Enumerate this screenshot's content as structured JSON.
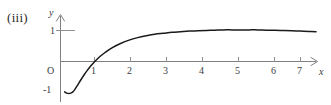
{
  "figure": {
    "label": "(iii)",
    "background_color": "#ffffff",
    "curve_color": "#1a1a1a",
    "axis_color": "#808080"
  },
  "chart_data": {
    "type": "line",
    "title": "",
    "subtitle": "",
    "xlabel": "x",
    "ylabel": "y",
    "figure_label": "(iii)",
    "origin_label": "O",
    "grid": false,
    "legend": null,
    "xlim": [
      -0.3,
      7.6
    ],
    "ylim": [
      -1.25,
      1.45
    ],
    "xticks": [
      1,
      2,
      3,
      4,
      5,
      6,
      7
    ],
    "xtick_labels": [
      "1",
      "2",
      "3",
      "4",
      "5",
      "6",
      "7"
    ],
    "yticks": [
      1
    ],
    "ytick_labels": [
      "1"
    ],
    "y_negative_ticks": [
      -1
    ],
    "y_negative_tick_labels": [
      "-1"
    ],
    "annotations": [],
    "series": [
      {
        "name": "curve",
        "x": [
          0.12,
          0.18,
          0.24,
          0.3,
          0.36,
          0.42,
          0.5,
          0.6,
          0.7,
          0.8,
          0.9,
          1.0,
          1.15,
          1.3,
          1.5,
          1.75,
          2.0,
          2.25,
          2.5,
          2.75,
          3.0,
          3.25,
          3.5,
          3.75,
          4.0,
          4.25,
          4.5,
          4.75,
          5.0,
          5.25,
          5.5,
          5.75,
          6.0,
          6.25,
          6.5,
          6.75,
          7.0,
          7.25,
          7.45
        ],
        "y": [
          -0.98,
          -1.02,
          -1.03,
          -1.02,
          -0.98,
          -0.9,
          -0.76,
          -0.58,
          -0.41,
          -0.26,
          -0.12,
          0.0,
          0.16,
          0.29,
          0.44,
          0.58,
          0.69,
          0.77,
          0.83,
          0.88,
          0.91,
          0.94,
          0.96,
          0.98,
          0.99,
          1.0,
          1.01,
          1.02,
          1.02,
          1.02,
          1.02,
          1.02,
          1.01,
          1.01,
          1.0,
          0.99,
          0.98,
          0.97,
          0.96
        ]
      }
    ]
  }
}
